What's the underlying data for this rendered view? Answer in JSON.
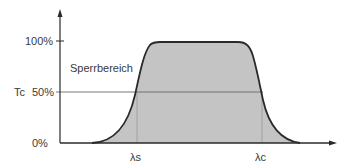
{
  "diagram": {
    "type": "filter-transmission-curve",
    "y_axis": {
      "ticks": [
        {
          "label": "100%",
          "value": 100
        },
        {
          "label": "50%",
          "value": 50
        },
        {
          "label": "0%",
          "value": 0
        }
      ],
      "threshold_label": "Tc"
    },
    "x_axis": {
      "markers": [
        {
          "label": "λs"
        },
        {
          "label": "λc"
        }
      ]
    },
    "region_label": "Sperrbereich",
    "colors": {
      "curve": "#2a2a2a",
      "fill": "#c4c4c4",
      "axis": "#2a2a2a",
      "guide": "#8a8a8a",
      "text": "#3a3a3a",
      "background": "#ffffff"
    }
  }
}
